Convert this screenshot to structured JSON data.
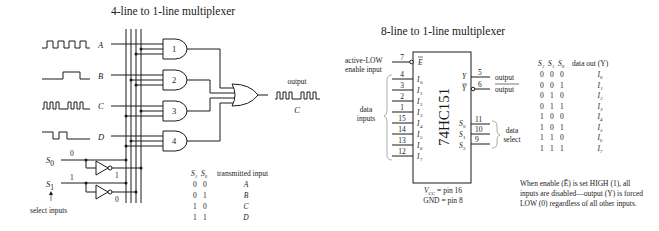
{
  "left_diagram": {
    "title": "4-line to 1-line multiplexer",
    "inputs": [
      {
        "label": "A",
        "waveform": "square-regular"
      },
      {
        "label": "B",
        "waveform": "single-pulse"
      },
      {
        "label": "C",
        "waveform": "burst-gap-burst"
      },
      {
        "label": "D",
        "waveform": "inverted-pulses"
      }
    ],
    "gates": [
      "1",
      "2",
      "3",
      "4"
    ],
    "output_label": "output",
    "output_signal": "C",
    "select": {
      "s0_label": "S",
      "s0_sub": "0",
      "s0_value": "0",
      "s0_inv_value": "1",
      "s1_label": "S",
      "s1_sub": "1",
      "s1_value": "1",
      "s1_inv_value": "0",
      "caption": "select inputs"
    },
    "truth_table": {
      "headers": [
        "S₁",
        "S₀",
        "transmitted input"
      ],
      "rows": [
        [
          "0",
          "0",
          "A"
        ],
        [
          "0",
          "1",
          "B"
        ],
        [
          "1",
          "0",
          "C"
        ],
        [
          "1",
          "1",
          "D"
        ]
      ]
    }
  },
  "right_diagram": {
    "title": "8-line to 1-line multiplexer",
    "chip_name": "74HC151",
    "enable": {
      "label_line1": "active-LOW",
      "label_line2": "enable input",
      "pin": "7",
      "pin_name": "E"
    },
    "data_inputs": {
      "label_line1": "data",
      "label_line2": "inputs",
      "pins": [
        {
          "pin": "4",
          "name": "I",
          "sub": "0"
        },
        {
          "pin": "3",
          "name": "I",
          "sub": "1"
        },
        {
          "pin": "2",
          "name": "I",
          "sub": "2"
        },
        {
          "pin": "1",
          "name": "I",
          "sub": "3"
        },
        {
          "pin": "15",
          "name": "I",
          "sub": "4"
        },
        {
          "pin": "14",
          "name": "I",
          "sub": "5"
        },
        {
          "pin": "13",
          "name": "I",
          "sub": "6"
        },
        {
          "pin": "12",
          "name": "I",
          "sub": "7"
        }
      ]
    },
    "outputs": [
      {
        "pin": "5",
        "name": "Y",
        "label": "output",
        "inverted": false
      },
      {
        "pin": "6",
        "name": "Y",
        "label": "output",
        "inverted": true
      }
    ],
    "select_pins": [
      {
        "pin": "11",
        "name": "S",
        "sub": "0"
      },
      {
        "pin": "10",
        "name": "S",
        "sub": "1"
      },
      {
        "pin": "9",
        "name": "S",
        "sub": "2"
      }
    ],
    "select_label_line1": "data",
    "select_label_line2": "select",
    "power": {
      "vcc": "V",
      "vcc_sub": "CC",
      "vcc_text": " = pin 16",
      "gnd_text": "GND = pin 8"
    },
    "truth_table": {
      "headers": [
        "S₂",
        "S₁",
        "S₀",
        "data out (Y)"
      ],
      "rows": [
        [
          "0",
          "0",
          "0",
          "I₀"
        ],
        [
          "0",
          "0",
          "1",
          "I₁"
        ],
        [
          "0",
          "1",
          "0",
          "I₂"
        ],
        [
          "0",
          "1",
          "1",
          "I₃"
        ],
        [
          "1",
          "0",
          "0",
          "I₄"
        ],
        [
          "1",
          "0",
          "1",
          "I₅"
        ],
        [
          "1",
          "1",
          "0",
          "I₆"
        ],
        [
          "1",
          "1",
          "1",
          "I₇"
        ]
      ]
    },
    "note_lines": [
      "When enable (Ē) is set HIGH (1), all",
      "inputs are disabled—output (Y) is forced",
      "LOW (0) regardless of all other inputs."
    ]
  }
}
